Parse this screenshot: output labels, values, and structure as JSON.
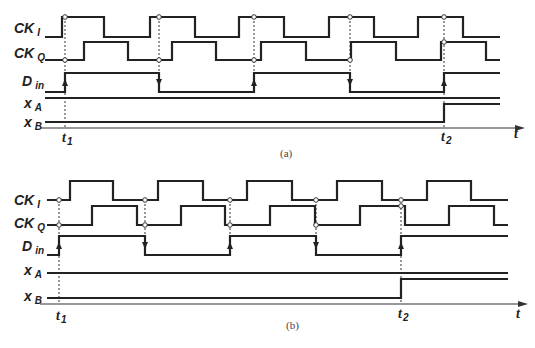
{
  "figure": {
    "width": 535,
    "height": 348,
    "colors": {
      "ink": "#222222",
      "background": "#ffffff"
    }
  },
  "panels": [
    {
      "id": "a",
      "caption": "(a)",
      "caption_pos": [
        280,
        157
      ],
      "x_start": 45,
      "x_end": 500,
      "signals": [
        {
          "name": "CK",
          "sub": "I",
          "label_pos": [
            14,
            33
          ],
          "low": 37,
          "high": 17,
          "start_level": 0,
          "edges": [
            62,
            104,
            150,
            195,
            239,
            284,
            329,
            374,
            418,
            463
          ]
        },
        {
          "name": "CK",
          "sub": "Q",
          "label_pos": [
            14,
            58
          ],
          "low": 60,
          "high": 42,
          "start_level": 0,
          "edges": [
            84,
            128,
            172,
            216,
            261,
            306,
            351,
            396,
            441,
            486
          ]
        },
        {
          "name": "D",
          "sub": "in",
          "label_pos": [
            22,
            86
          ],
          "low": 92,
          "high": 73,
          "start_level": 0,
          "edges": [
            65,
            159,
            254,
            350,
            444
          ],
          "arrows": [
            {
              "x": 65,
              "dir": "up"
            },
            {
              "x": 159,
              "dir": "down"
            },
            {
              "x": 254,
              "dir": "up"
            },
            {
              "x": 350,
              "dir": "down"
            },
            {
              "x": 444,
              "dir": "up"
            }
          ]
        },
        {
          "name": "x",
          "sub": "A",
          "label_pos": [
            24,
            108
          ],
          "low": 98,
          "high": 98,
          "start_level": 0,
          "edges": []
        },
        {
          "name": "x",
          "sub": "B",
          "label_pos": [
            24,
            127
          ],
          "low": 122,
          "high": 104,
          "start_level": 0,
          "edges": [
            444
          ]
        }
      ],
      "sample_points": [
        {
          "x": 65,
          "signal": 0
        },
        {
          "x": 65,
          "signal": 1
        },
        {
          "x": 159,
          "signal": 0
        },
        {
          "x": 159,
          "signal": 1
        },
        {
          "x": 254,
          "signal": 0
        },
        {
          "x": 254,
          "signal": 1
        },
        {
          "x": 350,
          "signal": 0
        },
        {
          "x": 350,
          "signal": 1
        },
        {
          "x": 444,
          "signal": 0
        },
        {
          "x": 444,
          "signal": 1
        }
      ],
      "dotted_lines": [
        {
          "x": 65,
          "y1": 17,
          "y2": 128
        },
        {
          "x": 159,
          "y1": 17,
          "y2": 92
        },
        {
          "x": 254,
          "y1": 17,
          "y2": 92
        },
        {
          "x": 350,
          "y1": 17,
          "y2": 92
        },
        {
          "x": 444,
          "y1": 17,
          "y2": 128
        }
      ],
      "axis": {
        "y": 128,
        "x1": 40,
        "x2": 525,
        "label": "t",
        "label_pos": [
          514,
          138
        ]
      },
      "time_marks": [
        {
          "label": "t",
          "sub": "1",
          "x": 62,
          "y": 142
        },
        {
          "label": "t",
          "sub": "2",
          "x": 441,
          "y": 141
        }
      ]
    },
    {
      "id": "b",
      "caption": "(b)",
      "caption_pos": [
        286,
        329
      ],
      "x_start": 47,
      "x_end": 508,
      "signals": [
        {
          "name": "CK",
          "sub": "I",
          "label_pos": [
            14,
            205
          ],
          "low": 200,
          "high": 181,
          "start_level": 0,
          "edges": [
            70,
            113,
            158,
            203,
            247,
            292,
            337,
            382,
            427,
            471
          ]
        },
        {
          "name": "CK",
          "sub": "Q",
          "label_pos": [
            14,
            228
          ],
          "low": 225,
          "high": 206,
          "start_level": 0,
          "edges": [
            92,
            137,
            181,
            225,
            270,
            315,
            360,
            405,
            449,
            494
          ]
        },
        {
          "name": "D",
          "sub": "in",
          "label_pos": [
            22,
            251
          ],
          "low": 255,
          "high": 236,
          "start_level": 0,
          "edges": [
            59,
            145,
            230,
            316,
            401
          ],
          "arrows": [
            {
              "x": 59,
              "dir": "up"
            },
            {
              "x": 145,
              "dir": "down"
            },
            {
              "x": 230,
              "dir": "up"
            },
            {
              "x": 316,
              "dir": "down"
            },
            {
              "x": 401,
              "dir": "up"
            }
          ]
        },
        {
          "name": "x",
          "sub": "A",
          "label_pos": [
            24,
            275
          ],
          "low": 273,
          "high": 273,
          "start_level": 0,
          "edges": []
        },
        {
          "name": "x",
          "sub": "B",
          "label_pos": [
            24,
            301
          ],
          "low": 298,
          "high": 279,
          "start_level": 0,
          "edges": [
            401
          ]
        }
      ],
      "sample_points": [
        {
          "x": 59,
          "signal": 0
        },
        {
          "x": 59,
          "signal": 1
        },
        {
          "x": 145,
          "signal": 0
        },
        {
          "x": 145,
          "signal": 1
        },
        {
          "x": 230,
          "signal": 0
        },
        {
          "x": 230,
          "signal": 1
        },
        {
          "x": 316,
          "signal": 0
        },
        {
          "x": 316,
          "signal": 1
        },
        {
          "x": 401,
          "signal": 0
        },
        {
          "x": 401,
          "signal": 1
        }
      ],
      "dotted_lines": [
        {
          "x": 59,
          "y1": 200,
          "y2": 304
        },
        {
          "x": 145,
          "y1": 200,
          "y2": 255
        },
        {
          "x": 230,
          "y1": 200,
          "y2": 255
        },
        {
          "x": 316,
          "y1": 200,
          "y2": 255
        },
        {
          "x": 401,
          "y1": 200,
          "y2": 304
        }
      ],
      "axis": {
        "y": 304,
        "x1": 40,
        "x2": 528,
        "label": "t",
        "label_pos": [
          516,
          318
        ]
      },
      "time_marks": [
        {
          "label": "t",
          "sub": "1",
          "x": 56,
          "y": 320
        },
        {
          "label": "t",
          "sub": "2",
          "x": 398,
          "y": 318
        }
      ]
    }
  ]
}
